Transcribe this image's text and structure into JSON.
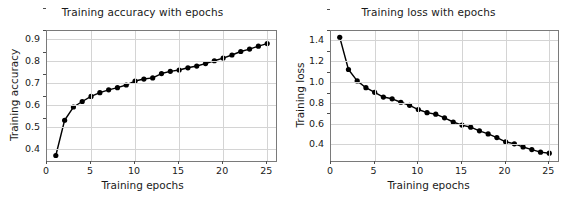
{
  "figure": {
    "background": "#ffffff",
    "line_color": "#000000",
    "marker_color": "#000000",
    "grid_color": "#d4d4d4",
    "axes_color": "#7a7a7a",
    "panels": 2
  },
  "chart_data": [
    {
      "type": "line",
      "title": "Training accuracy with epochs",
      "xlabel": "Training epochs",
      "ylabel": "Training accuracy",
      "grid": true,
      "legend": null,
      "marker": "circle",
      "xlim": [
        0,
        26
      ],
      "ylim": [
        0.345,
        0.935
      ],
      "xticks": [
        0,
        5,
        10,
        15,
        20,
        25
      ],
      "xticklabels": [
        "0",
        "5",
        "10",
        "15",
        "20",
        "25"
      ],
      "yticks": [
        0.4,
        0.5,
        0.6,
        0.7,
        0.8,
        0.9
      ],
      "yticklabels": [
        "0.4",
        "0.5",
        "0.6",
        "0.7",
        "0.8",
        "0.9"
      ],
      "x": [
        1,
        2,
        3,
        4,
        5,
        6,
        7,
        8,
        9,
        10,
        11,
        12,
        13,
        14,
        15,
        16,
        17,
        18,
        19,
        20,
        21,
        22,
        23,
        24,
        25
      ],
      "values": [
        0.37,
        0.53,
        0.59,
        0.615,
        0.638,
        0.655,
        0.668,
        0.678,
        0.69,
        0.708,
        0.717,
        0.722,
        0.742,
        0.752,
        0.758,
        0.768,
        0.776,
        0.787,
        0.8,
        0.812,
        0.826,
        0.842,
        0.853,
        0.866,
        0.878
      ]
    },
    {
      "type": "line",
      "title": "Training loss with epochs",
      "xlabel": "Training epochs",
      "ylabel": "Training loss",
      "grid": true,
      "legend": null,
      "marker": "circle",
      "xlim": [
        0,
        26
      ],
      "ylim": [
        0.24,
        1.49
      ],
      "xticks": [
        0,
        5,
        10,
        15,
        20,
        25
      ],
      "xticklabels": [
        "0",
        "5",
        "10",
        "15",
        "20",
        "25"
      ],
      "yticks": [
        0.4,
        0.6,
        0.8,
        1.0,
        1.2,
        1.4
      ],
      "yticklabels": [
        "0.4",
        "0.6",
        "0.8",
        "1.0",
        "1.2",
        "1.4"
      ],
      "x": [
        1,
        2,
        3,
        4,
        5,
        6,
        7,
        8,
        9,
        10,
        11,
        12,
        13,
        14,
        15,
        16,
        17,
        18,
        19,
        20,
        21,
        22,
        23,
        24,
        25
      ],
      "values": [
        1.43,
        1.12,
        1.01,
        0.945,
        0.9,
        0.855,
        0.838,
        0.805,
        0.775,
        0.735,
        0.705,
        0.69,
        0.655,
        0.615,
        0.585,
        0.565,
        0.53,
        0.5,
        0.465,
        0.425,
        0.405,
        0.375,
        0.35,
        0.325,
        0.315
      ]
    }
  ]
}
